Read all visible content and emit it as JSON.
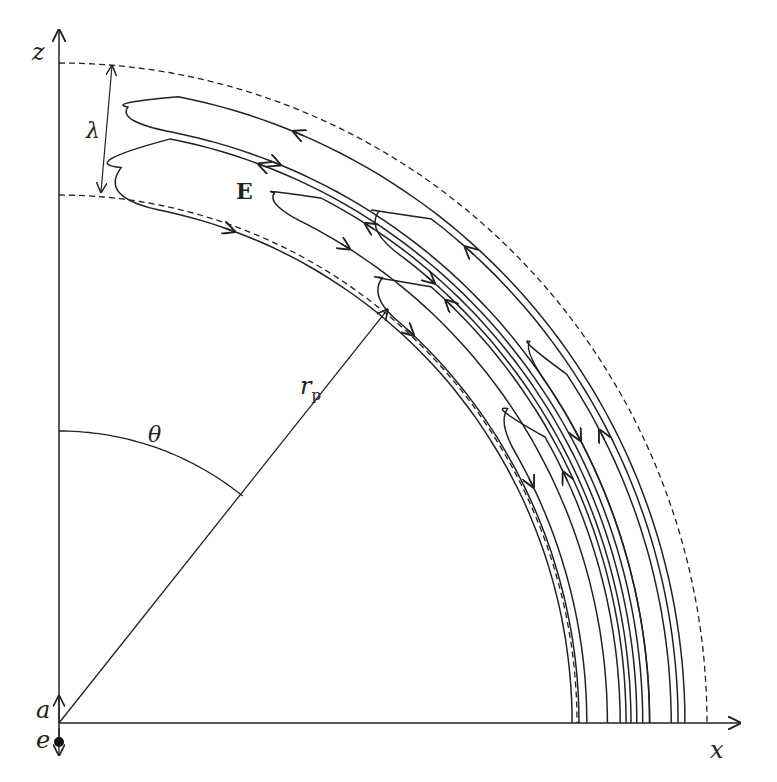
{
  "figure": {
    "labels": {
      "z_axis": "z",
      "x_axis": "x",
      "lambda": "λ",
      "field": "E",
      "radius": "r",
      "radius_sub": "p",
      "angle": "θ",
      "a": "a",
      "e": "e"
    },
    "geometry": {
      "origin": [
        59,
        723
      ],
      "inner_boundary": {
        "rx": 518,
        "ry": 528
      },
      "outer_boundary": {
        "rx": 648,
        "ry": 660
      },
      "theta_arc_radius": 292,
      "theta_angle_deg": 39,
      "rp_length": 532
    },
    "loops": [
      {
        "tip_deg": 8,
        "r_out": 638,
        "r_in": 602,
        "arrow_out_dir": "in",
        "arrow_deg": 22
      },
      {
        "tip_deg": 8,
        "r_out": 595,
        "r_in": 523,
        "arrow_out_dir": "out",
        "arrow_deg": 20
      },
      {
        "tip_deg": 24,
        "r_out": 589,
        "r_in": 559,
        "arrow_out_dir": "out",
        "arrow_deg": 32
      },
      {
        "tip_deg": 34,
        "r_out": 631,
        "r_in": 583,
        "arrow_out_dir": "in",
        "arrow_deg": 41
      },
      {
        "tip_deg": 38,
        "r_out": 578,
        "r_in": 530,
        "arrow_out_dir": "out",
        "arrow_deg": 43
      },
      {
        "tip_deg": 53,
        "r_out": 624,
        "r_in": 602,
        "arrow_out_dir": "in",
        "arrow_deg": 62
      },
      {
        "tip_deg": 57,
        "r_out": 572,
        "r_in": 538,
        "arrow_out_dir": "out",
        "arrow_deg": 64
      }
    ],
    "colors": {
      "ink": "#222222",
      "background": "#ffffff"
    }
  }
}
